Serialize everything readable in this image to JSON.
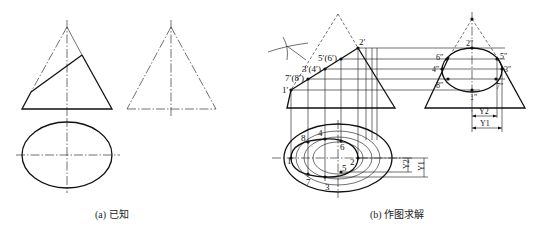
{
  "figure_a": {
    "caption": "(a) 已知",
    "views": [
      "front-view",
      "side-view",
      "top-view"
    ]
  },
  "figure_b": {
    "caption": "(b) 作图求解",
    "front_labels": {
      "p1": "1′",
      "p2": "2′",
      "p34": "3′(4′)",
      "p56": "5′(6′)",
      "p78": "7′(8′)"
    },
    "side_labels": {
      "p1": "1″",
      "p2": "2″",
      "p3": "3″",
      "p4": "4″",
      "p5": "5″",
      "p6": "6″",
      "p7": "7″",
      "p8": "8″"
    },
    "top_labels": {
      "p1": "1",
      "p2": "2",
      "p3": "3",
      "p4": "4",
      "p5": "5",
      "p6": "6",
      "p7": "7",
      "p8": "8"
    },
    "dimensions": {
      "y1": "Y1",
      "y2": "Y2"
    }
  },
  "colors": {
    "line": "#111111",
    "background": "#ffffff"
  }
}
